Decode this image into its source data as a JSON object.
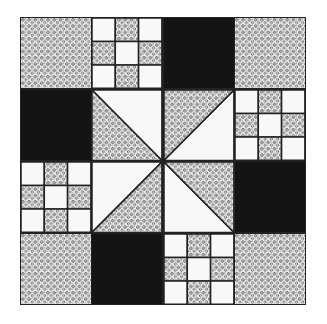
{
  "quilt": {
    "colors": {
      "dark": "#141414",
      "light": "#f8f8f8",
      "line": "#222222",
      "print_bg": "#e8e8e8",
      "print_fg": "#333333"
    },
    "grid": [
      [
        "print",
        "ninepatch",
        "dark",
        "print"
      ],
      [
        "dark",
        "hst-tlbr-bl",
        "hst-trbl-tl",
        "ninepatch"
      ],
      [
        "ninepatch",
        "hst-trbl-br",
        "hst-tlbr-tr",
        "dark"
      ],
      [
        "print",
        "dark",
        "ninepatch",
        "print"
      ]
    ]
  }
}
